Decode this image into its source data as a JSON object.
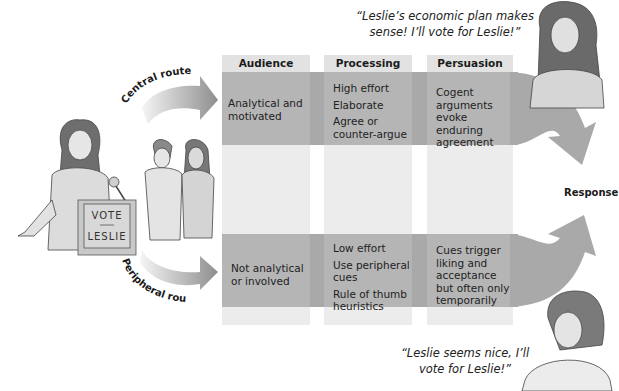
{
  "figure": {
    "speaker": {
      "podium_sign_line1": "VOTE",
      "podium_sign_line2": "LESLIE"
    },
    "routes": {
      "central_label": "Central route",
      "peripheral_label": "Peripheral route"
    },
    "columns": [
      {
        "header": "Audience"
      },
      {
        "header": "Processing"
      },
      {
        "header": "Persuasion"
      }
    ],
    "central": {
      "audience": "Analytical and motivated",
      "processing": [
        "High effort",
        "Elaborate",
        "Agree or counter-argue"
      ],
      "persuasion": "Cogent arguments evoke enduring agreement"
    },
    "peripheral": {
      "audience": "Not analytical or involved",
      "processing": [
        "Low effort",
        "Use peripheral cues",
        "Rule of thumb heuristics"
      ],
      "persuasion": "Cues trigger liking and acceptance but often only temporarily"
    },
    "response_label": "Response",
    "quotes": {
      "central_line1": "“Leslie’s economic plan makes",
      "central_line2": "sense! I’ll vote for Leslie!”",
      "peripheral_line1": "“Leslie seems nice, I’ll",
      "peripheral_line2": "vote for Leslie!”"
    },
    "colors": {
      "band": "#a9a9a9",
      "band_in_column": "#b5b5b5",
      "column_light": "#ececec",
      "column_header": "#e2e2e2",
      "route_arrow_start": "#f4f4f4",
      "route_arrow_end": "#8f8f8f"
    }
  }
}
